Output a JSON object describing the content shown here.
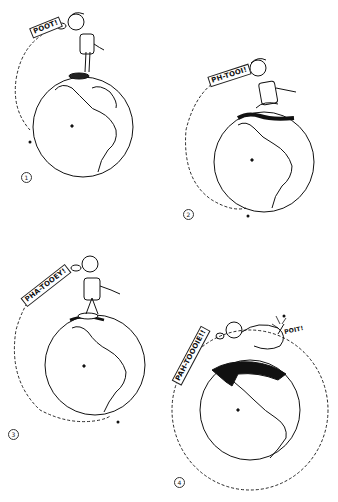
{
  "illustration": {
    "description": "Four-panel cartoon: a boy standing on top of Earth spits with increasing force; the spit travels farther around the globe each time, and in panel 4 it circles the whole planet and hits him from behind.",
    "colors": {
      "ink": "#111111",
      "paper": "#ffffff"
    },
    "panels": [
      {
        "number": "1",
        "sound": "POOT!"
      },
      {
        "number": "2",
        "sound": "PH-TOOI!"
      },
      {
        "number": "3",
        "sound": "PHA-TOOEY!"
      },
      {
        "number": "4",
        "sound": "PAH-TOOOIE!!",
        "impact_sound": "POIT!"
      }
    ]
  }
}
